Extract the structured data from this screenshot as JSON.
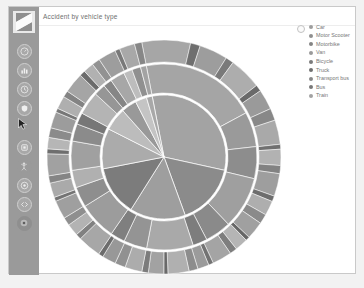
{
  "window": {
    "title": "Accident by vehicle type"
  },
  "sidebar": {
    "logo_name": "app-logo",
    "items": [
      {
        "name": "dashboard",
        "glyph": "◴"
      },
      {
        "name": "bar-chart",
        "glyph": "▐"
      },
      {
        "name": "clock",
        "glyph": "◷"
      },
      {
        "name": "shield",
        "glyph": "▼"
      },
      {
        "name": "layers",
        "glyph": "▣"
      },
      {
        "name": "people",
        "glyph": "Ж"
      },
      {
        "name": "target",
        "glyph": "◉"
      },
      {
        "name": "code",
        "glyph": "‹›"
      },
      {
        "name": "settings",
        "glyph": "◉"
      }
    ]
  },
  "legend": {
    "toggle_name": "legend-toggle",
    "items": [
      {
        "label": "Car",
        "color": "#9d9d9d"
      },
      {
        "label": "Motor Scooter",
        "color": "#8f8f8f"
      },
      {
        "label": "Motorbike",
        "color": "#848484"
      },
      {
        "label": "Van",
        "color": "#9a9a9a"
      },
      {
        "label": "Bicycle",
        "color": "#7b7b7b"
      },
      {
        "label": "Truck",
        "color": "#6f6f6f"
      },
      {
        "label": "Transport bus",
        "color": "#888888"
      },
      {
        "label": "Bus",
        "color": "#787878"
      },
      {
        "label": "Train",
        "color": "#a2a2a2"
      }
    ]
  },
  "chart_data": {
    "type": "pie",
    "title": "Accident by vehicle type",
    "subtype": "sunburst",
    "center": [
      155,
      150
    ],
    "rings": [
      {
        "name": "inner",
        "r_inner": 0,
        "r_outer": 62
      },
      {
        "name": "middle",
        "r_inner": 64,
        "r_outer": 93
      },
      {
        "name": "outer",
        "r_inner": 95,
        "r_outer": 117
      }
    ],
    "categories": [
      "Car",
      "Motor Scooter",
      "Motorbike",
      "Van",
      "Bicycle",
      "Truck",
      "Transport bus",
      "Bus",
      "Train"
    ],
    "values": [
      31.5,
      16.0,
      14.5,
      13.0,
      10.5,
      6.0,
      4.0,
      3.0,
      1.5
    ],
    "ring1": [
      {
        "label": "Car",
        "value": 31.5,
        "color": "#a3a3a3"
      },
      {
        "label": "Motor Scooter",
        "value": 16.0,
        "color": "#8b8b8b"
      },
      {
        "label": "Motorbike",
        "value": 14.5,
        "color": "#9e9e9e"
      },
      {
        "label": "Van",
        "value": 13.0,
        "color": "#7c7c7c"
      },
      {
        "label": "Bicycle",
        "value": 10.5,
        "color": "#ababab"
      },
      {
        "label": "Truck",
        "value": 6.0,
        "color": "#bcbcbc"
      },
      {
        "label": "Transport bus",
        "value": 4.0,
        "color": "#999999"
      },
      {
        "label": "Bus",
        "value": 3.0,
        "color": "#c4c4c4"
      },
      {
        "label": "Train",
        "value": 1.5,
        "color": "#a8a8a8"
      }
    ],
    "ring2": [
      {
        "value": 20.0,
        "color": "#a5a5a5"
      },
      {
        "value": 6.0,
        "color": "#9a9a9a"
      },
      {
        "value": 5.5,
        "color": "#8d8d8d"
      },
      {
        "value": 9.0,
        "color": "#9f9f9f"
      },
      {
        "value": 4.5,
        "color": "#8a8a8a"
      },
      {
        "value": 2.5,
        "color": "#7d7d7d"
      },
      {
        "value": 8.0,
        "color": "#a9a9a9"
      },
      {
        "value": 4.0,
        "color": "#949494"
      },
      {
        "value": 2.5,
        "color": "#7f7f7f"
      },
      {
        "value": 6.5,
        "color": "#9c9c9c"
      },
      {
        "value": 3.5,
        "color": "#8e8e8e"
      },
      {
        "value": 3.0,
        "color": "#b0b0b0"
      },
      {
        "value": 5.0,
        "color": "#a0a0a0"
      },
      {
        "value": 3.0,
        "color": "#8b8b8b"
      },
      {
        "value": 2.0,
        "color": "#777777"
      },
      {
        "value": 4.0,
        "color": "#b4b4b4"
      },
      {
        "value": 2.0,
        "color": "#969696"
      },
      {
        "value": 1.5,
        "color": "#868686"
      },
      {
        "value": 2.5,
        "color": "#a7a7a7"
      },
      {
        "value": 1.5,
        "color": "#bdbdbd"
      },
      {
        "value": 1.5,
        "color": "#909090"
      },
      {
        "value": 1.0,
        "color": "#a3a3a3"
      }
    ],
    "ring3": [
      {
        "value": 6.0,
        "color": "#a6a6a6"
      },
      {
        "value": 1.2,
        "color": "#6f6f6f"
      },
      {
        "value": 3.5,
        "color": "#9d9d9d"
      },
      {
        "value": 1.0,
        "color": "#7a7a7a"
      },
      {
        "value": 4.0,
        "color": "#adadad"
      },
      {
        "value": 0.8,
        "color": "#6a6a6a"
      },
      {
        "value": 2.5,
        "color": "#9a9a9a"
      },
      {
        "value": 1.5,
        "color": "#888888"
      },
      {
        "value": 3.0,
        "color": "#a9a9a9"
      },
      {
        "value": 0.6,
        "color": "#707070"
      },
      {
        "value": 2.0,
        "color": "#b2b2b2"
      },
      {
        "value": 1.0,
        "color": "#828282"
      },
      {
        "value": 2.8,
        "color": "#9e9e9e"
      },
      {
        "value": 0.7,
        "color": "#6d6d6d"
      },
      {
        "value": 1.8,
        "color": "#aeaeae"
      },
      {
        "value": 1.2,
        "color": "#8a8a8a"
      },
      {
        "value": 2.2,
        "color": "#a0a0a0"
      },
      {
        "value": 0.5,
        "color": "#666666"
      },
      {
        "value": 1.6,
        "color": "#b5b5b5"
      },
      {
        "value": 0.9,
        "color": "#7e7e7e"
      },
      {
        "value": 2.4,
        "color": "#a4a4a4"
      },
      {
        "value": 0.6,
        "color": "#737373"
      },
      {
        "value": 1.4,
        "color": "#9b9b9b"
      },
      {
        "value": 1.1,
        "color": "#8d8d8d"
      },
      {
        "value": 2.6,
        "color": "#b0b0b0"
      },
      {
        "value": 0.5,
        "color": "#696969"
      },
      {
        "value": 1.9,
        "color": "#a2a2a2"
      },
      {
        "value": 0.8,
        "color": "#7c7c7c"
      },
      {
        "value": 2.1,
        "color": "#acacac"
      },
      {
        "value": 1.3,
        "color": "#919191"
      },
      {
        "value": 1.7,
        "color": "#989898"
      },
      {
        "value": 0.6,
        "color": "#6c6c6c"
      },
      {
        "value": 2.9,
        "color": "#a7a7a7"
      },
      {
        "value": 0.7,
        "color": "#818181"
      },
      {
        "value": 1.5,
        "color": "#b3b3b3"
      },
      {
        "value": 1.0,
        "color": "#8f8f8f"
      },
      {
        "value": 2.3,
        "color": "#9f9f9f"
      },
      {
        "value": 0.5,
        "color": "#747474"
      },
      {
        "value": 1.8,
        "color": "#aaaaaa"
      },
      {
        "value": 0.9,
        "color": "#858585"
      },
      {
        "value": 2.7,
        "color": "#a1a1a1"
      },
      {
        "value": 0.6,
        "color": "#6e6e6e"
      },
      {
        "value": 1.4,
        "color": "#b6b6b6"
      },
      {
        "value": 1.2,
        "color": "#8b8b8b"
      },
      {
        "value": 2.0,
        "color": "#9c9c9c"
      },
      {
        "value": 0.5,
        "color": "#777777"
      },
      {
        "value": 1.6,
        "color": "#afafaf"
      },
      {
        "value": 0.8,
        "color": "#838383"
      },
      {
        "value": 2.5,
        "color": "#a5a5a5"
      },
      {
        "value": 0.7,
        "color": "#6b6b6b"
      },
      {
        "value": 1.3,
        "color": "#b1b1b1"
      },
      {
        "value": 1.0,
        "color": "#929292"
      },
      {
        "value": 2.2,
        "color": "#9d9d9d"
      },
      {
        "value": 0.6,
        "color": "#797979"
      },
      {
        "value": 1.9,
        "color": "#a8a8a8"
      },
      {
        "value": 0.9,
        "color": "#878787"
      }
    ]
  }
}
